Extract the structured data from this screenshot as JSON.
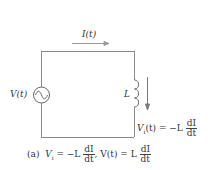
{
  "diagram": {
    "type": "circuit",
    "current_label": "I(t)",
    "source_label": "V(t)",
    "inductor_label": "L",
    "inductor_voltage": {
      "lhs": "V",
      "lhs_sub": "i",
      "lhs_arg": "(t) = −L",
      "frac_num": "dI",
      "frac_den": "dt"
    },
    "caption": {
      "prefix": "(a)",
      "part1_lhs": "V",
      "part1_sub": "i",
      "part1_eq": " = −L",
      "part1_frac_num": "dI",
      "part1_frac_den": "dt",
      "sep": ",",
      "part2_lhs": "V(t) = L",
      "part2_frac_num": "dI",
      "part2_frac_den": "dt"
    },
    "colors": {
      "wire": "#8a8a8a",
      "arrow": "#8a8a8a",
      "text": "#333333"
    }
  }
}
